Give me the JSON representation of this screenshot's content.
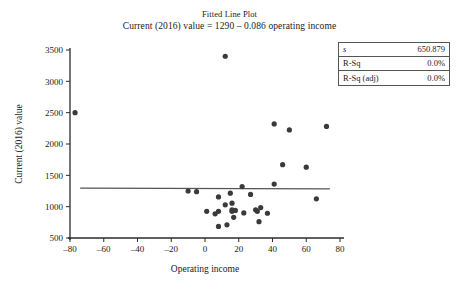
{
  "figure": {
    "title": "Fitted Line Plot",
    "subtitle": "Current (2016) value = 1290 – 0.086 operating income"
  },
  "stats_box": {
    "rows": [
      {
        "key": "s",
        "value": "650.879",
        "italic": true
      },
      {
        "key": "R-Sq",
        "value": "0.0%",
        "italic": false
      },
      {
        "key": "R-Sq (adj)",
        "value": "0.0%",
        "italic": false
      }
    ]
  },
  "chart_data": {
    "type": "scatter",
    "title": "Fitted Line Plot",
    "subtitle": "Current (2016) value = 1290 – 0.086 operating income",
    "xlabel": "Operating income",
    "ylabel": "Current (2016) value",
    "xlim": [
      -80,
      80
    ],
    "ylim": [
      500,
      3500
    ],
    "xticks": [
      -80,
      -60,
      -40,
      -20,
      0,
      20,
      40,
      60,
      80
    ],
    "xtick_labels": [
      "–80",
      "–60",
      "–40",
      "–20",
      "0",
      "20",
      "40",
      "60",
      "80"
    ],
    "yticks": [
      500,
      1000,
      1500,
      2000,
      2500,
      3000,
      3500
    ],
    "ytick_labels": [
      "500",
      "1000",
      "1500",
      "2000",
      "2500",
      "3000",
      "3500"
    ],
    "grid": false,
    "legend": "none",
    "marker": {
      "shape": "circle",
      "size": 2.6,
      "color": "#3a3a3a"
    },
    "points": [
      {
        "x": -77,
        "y": 2500
      },
      {
        "x": -10,
        "y": 1250
      },
      {
        "x": -5,
        "y": 1240
      },
      {
        "x": 1,
        "y": 925
      },
      {
        "x": 6,
        "y": 885
      },
      {
        "x": 8,
        "y": 1155
      },
      {
        "x": 8,
        "y": 925
      },
      {
        "x": 8,
        "y": 685
      },
      {
        "x": 12,
        "y": 3400
      },
      {
        "x": 12,
        "y": 1030
      },
      {
        "x": 13,
        "y": 710
      },
      {
        "x": 15,
        "y": 1215
      },
      {
        "x": 16,
        "y": 1055
      },
      {
        "x": 16,
        "y": 950
      },
      {
        "x": 16,
        "y": 925
      },
      {
        "x": 17,
        "y": 830
      },
      {
        "x": 18,
        "y": 940
      },
      {
        "x": 22,
        "y": 1320
      },
      {
        "x": 23,
        "y": 900
      },
      {
        "x": 27,
        "y": 1195
      },
      {
        "x": 30,
        "y": 950
      },
      {
        "x": 31,
        "y": 925
      },
      {
        "x": 32,
        "y": 760
      },
      {
        "x": 33,
        "y": 985
      },
      {
        "x": 37,
        "y": 895
      },
      {
        "x": 41,
        "y": 2320
      },
      {
        "x": 41,
        "y": 1360
      },
      {
        "x": 46,
        "y": 1670
      },
      {
        "x": 50,
        "y": 2225
      },
      {
        "x": 60,
        "y": 1630
      },
      {
        "x": 66,
        "y": 1125
      },
      {
        "x": 72,
        "y": 2280
      }
    ],
    "fit_line": {
      "intercept": 1290,
      "slope": -0.086,
      "x_start": -74,
      "x_end": 74,
      "color": "#555555",
      "width": 1.2
    }
  }
}
